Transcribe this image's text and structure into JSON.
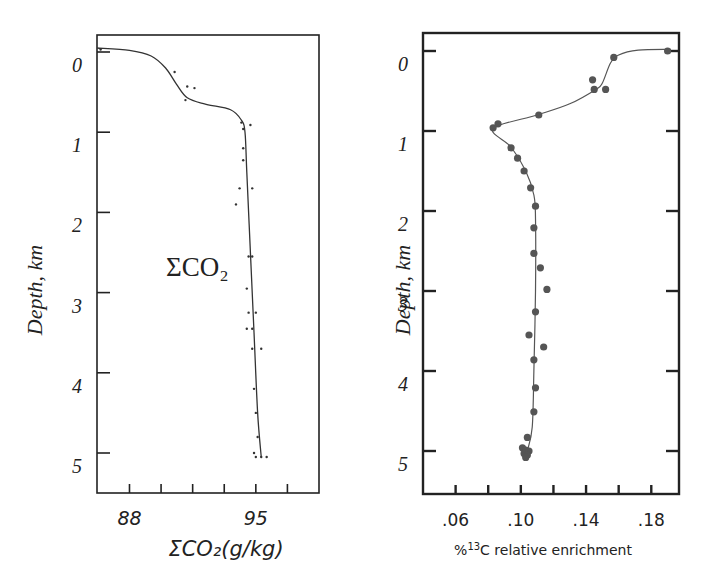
{
  "chart_data": [
    {
      "type": "scatter",
      "title": "",
      "xlabel": "ΣCO₂(g/kg)",
      "ylabel": "Depth, km",
      "annotation": "ΣCO₂",
      "xlim": [
        86.2,
        98.5
      ],
      "ylim": [
        5.5,
        -0.2
      ],
      "y_inverted": true,
      "x_tick_labels": [
        {
          "value": 88,
          "label": "88"
        },
        {
          "value": 95,
          "label": "95"
        }
      ],
      "x_minor_ticks": [
        88,
        89.75,
        91.5,
        93.25,
        95,
        96.75
      ],
      "y_tick_labels": [
        "0",
        "1",
        "2",
        "3",
        "4",
        "5"
      ],
      "y_ticks": [
        0,
        1,
        2,
        3,
        4,
        5
      ],
      "grid": false,
      "series": [
        {
          "name": "ΣCO₂ observations",
          "style": "points",
          "points": [
            {
              "x": 86.4,
              "y": -0.03
            },
            {
              "x": 90.5,
              "y": 0.25
            },
            {
              "x": 91.2,
              "y": 0.43
            },
            {
              "x": 91.6,
              "y": 0.45
            },
            {
              "x": 91.1,
              "y": 0.6
            },
            {
              "x": 94.2,
              "y": 0.88
            },
            {
              "x": 94.7,
              "y": 0.91
            },
            {
              "x": 94.3,
              "y": 0.96
            },
            {
              "x": 94.3,
              "y": 1.2
            },
            {
              "x": 94.3,
              "y": 1.35
            },
            {
              "x": 94.1,
              "y": 1.7
            },
            {
              "x": 94.8,
              "y": 1.7
            },
            {
              "x": 93.9,
              "y": 1.9
            },
            {
              "x": 94.6,
              "y": 2.55
            },
            {
              "x": 94.8,
              "y": 2.55
            },
            {
              "x": 94.5,
              "y": 2.95
            },
            {
              "x": 94.6,
              "y": 3.25
            },
            {
              "x": 95.0,
              "y": 3.25
            },
            {
              "x": 94.5,
              "y": 3.45
            },
            {
              "x": 94.8,
              "y": 3.45
            },
            {
              "x": 94.8,
              "y": 3.7
            },
            {
              "x": 95.3,
              "y": 3.7
            },
            {
              "x": 94.9,
              "y": 4.2
            },
            {
              "x": 95.0,
              "y": 4.5
            },
            {
              "x": 95.1,
              "y": 4.8
            },
            {
              "x": 94.9,
              "y": 5.0
            },
            {
              "x": 95.0,
              "y": 5.05
            },
            {
              "x": 95.3,
              "y": 5.05
            },
            {
              "x": 95.6,
              "y": 5.05
            }
          ]
        },
        {
          "name": "ΣCO₂ fitted profile",
          "style": "line",
          "points": [
            {
              "x": 86.2,
              "y": -0.05
            },
            {
              "x": 88.0,
              "y": -0.02
            },
            {
              "x": 89.2,
              "y": 0.05
            },
            {
              "x": 90.0,
              "y": 0.2
            },
            {
              "x": 90.6,
              "y": 0.4
            },
            {
              "x": 91.2,
              "y": 0.57
            },
            {
              "x": 92.2,
              "y": 0.65
            },
            {
              "x": 93.6,
              "y": 0.72
            },
            {
              "x": 94.2,
              "y": 0.85
            },
            {
              "x": 94.4,
              "y": 1.0
            },
            {
              "x": 94.5,
              "y": 1.5
            },
            {
              "x": 94.7,
              "y": 2.5
            },
            {
              "x": 94.9,
              "y": 3.5
            },
            {
              "x": 95.1,
              "y": 4.5
            },
            {
              "x": 95.3,
              "y": 5.05
            }
          ]
        }
      ]
    },
    {
      "type": "scatter",
      "title": "",
      "xlabel": "%13C relative enrichment",
      "xlabel_parts": {
        "prefix": "%",
        "superscript": "13",
        "suffix": "C relative enrichment"
      },
      "ylabel": "Depth, km",
      "xlim": [
        0.04,
        0.197
      ],
      "ylim": [
        5.55,
        -0.22
      ],
      "y_inverted": true,
      "x_tick_labels": [
        {
          "value": 0.06,
          "label": ".06"
        },
        {
          "value": 0.1,
          "label": ".10"
        },
        {
          "value": 0.14,
          "label": ".14"
        },
        {
          "value": 0.18,
          "label": ".18"
        }
      ],
      "x_minor_ticks": [
        0.06,
        0.08,
        0.1,
        0.12,
        0.14,
        0.16,
        0.18
      ],
      "y_tick_labels": [
        "0",
        "1",
        "2",
        "3",
        "4",
        "5"
      ],
      "y_ticks": [
        0,
        1,
        2,
        3,
        4,
        5
      ],
      "grid": false,
      "series": [
        {
          "name": "13C enrichment observations",
          "style": "dots",
          "color": "#555555",
          "points": [
            {
              "x": 0.19,
              "y": 0.0
            },
            {
              "x": 0.157,
              "y": 0.08
            },
            {
              "x": 0.144,
              "y": 0.36
            },
            {
              "x": 0.145,
              "y": 0.48
            },
            {
              "x": 0.152,
              "y": 0.48
            },
            {
              "x": 0.111,
              "y": 0.8
            },
            {
              "x": 0.086,
              "y": 0.91
            },
            {
              "x": 0.083,
              "y": 0.96
            },
            {
              "x": 0.094,
              "y": 1.21
            },
            {
              "x": 0.098,
              "y": 1.34
            },
            {
              "x": 0.102,
              "y": 1.5
            },
            {
              "x": 0.106,
              "y": 1.71
            },
            {
              "x": 0.109,
              "y": 1.94
            },
            {
              "x": 0.108,
              "y": 2.21
            },
            {
              "x": 0.108,
              "y": 2.53
            },
            {
              "x": 0.112,
              "y": 2.71
            },
            {
              "x": 0.116,
              "y": 2.98
            },
            {
              "x": 0.109,
              "y": 3.26
            },
            {
              "x": 0.105,
              "y": 3.55
            },
            {
              "x": 0.114,
              "y": 3.7
            },
            {
              "x": 0.108,
              "y": 3.86
            },
            {
              "x": 0.109,
              "y": 4.21
            },
            {
              "x": 0.108,
              "y": 4.51
            },
            {
              "x": 0.104,
              "y": 4.83
            },
            {
              "x": 0.101,
              "y": 4.96
            },
            {
              "x": 0.103,
              "y": 4.99
            },
            {
              "x": 0.105,
              "y": 5.0
            },
            {
              "x": 0.102,
              "y": 5.03
            },
            {
              "x": 0.104,
              "y": 5.05
            },
            {
              "x": 0.103,
              "y": 5.08
            }
          ]
        },
        {
          "name": "13C enrichment fitted profile",
          "style": "line",
          "color": "#555555",
          "points": [
            {
              "x": 0.192,
              "y": -0.02
            },
            {
              "x": 0.172,
              "y": -0.01
            },
            {
              "x": 0.16,
              "y": 0.05
            },
            {
              "x": 0.155,
              "y": 0.15
            },
            {
              "x": 0.15,
              "y": 0.4
            },
            {
              "x": 0.146,
              "y": 0.48
            },
            {
              "x": 0.13,
              "y": 0.66
            },
            {
              "x": 0.11,
              "y": 0.8
            },
            {
              "x": 0.083,
              "y": 0.97
            },
            {
              "x": 0.094,
              "y": 1.2
            },
            {
              "x": 0.103,
              "y": 1.5
            },
            {
              "x": 0.108,
              "y": 1.8
            },
            {
              "x": 0.109,
              "y": 2.1
            },
            {
              "x": 0.109,
              "y": 3.0
            },
            {
              "x": 0.108,
              "y": 4.0
            },
            {
              "x": 0.107,
              "y": 4.7
            },
            {
              "x": 0.104,
              "y": 5.0
            }
          ]
        }
      ]
    }
  ]
}
